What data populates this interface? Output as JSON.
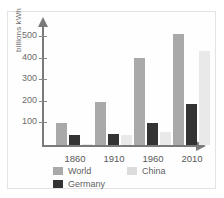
{
  "chart_data": {
    "type": "bar",
    "title": "",
    "subtitle": "",
    "xlabel": "",
    "ylabel": "billions kWh",
    "categories": [
      "1860",
      "1910",
      "1960",
      "2010"
    ],
    "series": [
      {
        "name": "World",
        "color": "#a9a9a9",
        "values": [
          100,
          200,
          405,
          515
        ]
      },
      {
        "name": "Germany",
        "color": "#333333",
        "values": [
          45,
          50,
          100,
          190
        ]
      },
      {
        "name": "China",
        "color": "#e9e9e9",
        "values": [
          5,
          45,
          58,
          435
        ]
      }
    ],
    "yticks": [
      100,
      200,
      300,
      400,
      500
    ],
    "ytick_labels": [
      "100",
      "200",
      "300",
      "400",
      "500"
    ],
    "ylim": [
      0,
      560
    ],
    "grid": false,
    "legend_position": "below-axis",
    "legend_entries": [
      {
        "label": "World",
        "swatch": "#a9a9a9"
      },
      {
        "label": "China",
        "swatch": "#dcdcdc"
      },
      {
        "label": "Germany",
        "swatch": "#333333"
      }
    ]
  }
}
